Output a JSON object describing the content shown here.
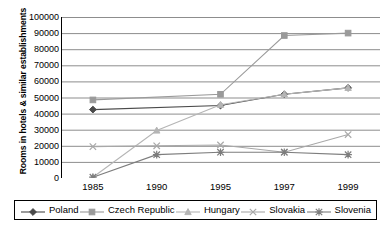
{
  "chart_data": {
    "type": "line",
    "title": "",
    "xlabel": "",
    "ylabel": "Rooms in hotels & similar establishments",
    "categories": [
      "1985",
      "1990",
      "1995",
      "1997",
      "1999"
    ],
    "ylim": [
      0,
      100000
    ],
    "ytick_labels": [
      "0",
      "10000",
      "20000",
      "30000",
      "40000",
      "50000",
      "60000",
      "70000",
      "80000",
      "90000",
      "100000"
    ],
    "ytick_values": [
      0,
      10000,
      20000,
      30000,
      40000,
      50000,
      60000,
      70000,
      80000,
      90000,
      100000
    ],
    "grid": true,
    "legend_position": "bottom",
    "series": [
      {
        "name": "Poland",
        "marker": "diamond",
        "color": "#4a4a4a",
        "values": [
          42500,
          null,
          45000,
          52000,
          56000
        ]
      },
      {
        "name": "Czech Republic",
        "marker": "square",
        "color": "#9a9a9a",
        "values": [
          48500,
          null,
          52000,
          88500,
          90000
        ]
      },
      {
        "name": "Hungary",
        "marker": "triangle",
        "color": "#b5b5b5",
        "values": [
          500,
          29500,
          45500,
          52000,
          56000
        ]
      },
      {
        "name": "Slovakia",
        "marker": "cross",
        "color": "#a8a8a8",
        "values": [
          19500,
          20000,
          20500,
          16000,
          27000
        ]
      },
      {
        "name": "Slovenia",
        "marker": "asterisk",
        "color": "#7d7d7d",
        "values": [
          500,
          14500,
          16000,
          16000,
          14500
        ]
      }
    ]
  }
}
